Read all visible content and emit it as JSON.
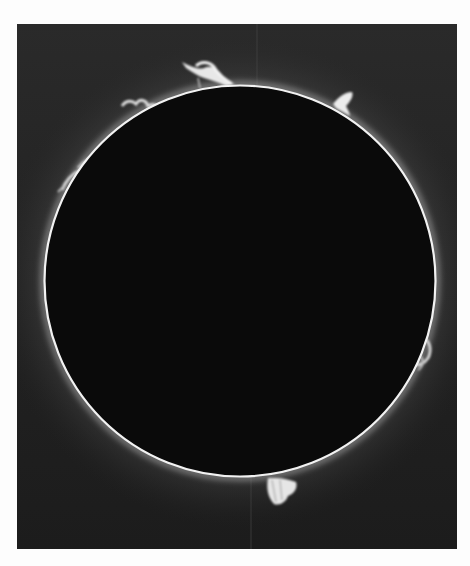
{
  "image": {
    "subject": "total-solar-eclipse-with-prominences",
    "page_background": "#fdfdfd",
    "frame": {
      "x": 17,
      "y": 24,
      "width": 440,
      "height": 525,
      "color": "#242424"
    },
    "disk": {
      "cx": 240,
      "cy": 281,
      "r": 195,
      "fill": "#0a0a0a",
      "limb_color": "#f2f2f2"
    },
    "corona_glow_color": "#cfcfcf",
    "prominences": [
      {
        "name": "top-left-loop",
        "position": "upper limb, ~11 o'clock"
      },
      {
        "name": "top-right-spike",
        "position": "upper-right limb, ~1 o'clock"
      },
      {
        "name": "left-arc-cluster",
        "position": "upper-left limb, ~10 o'clock"
      },
      {
        "name": "right-loop",
        "position": "right limb, ~4 o'clock"
      },
      {
        "name": "bottom-plume",
        "position": "lower limb, ~6 o'clock"
      }
    ]
  }
}
